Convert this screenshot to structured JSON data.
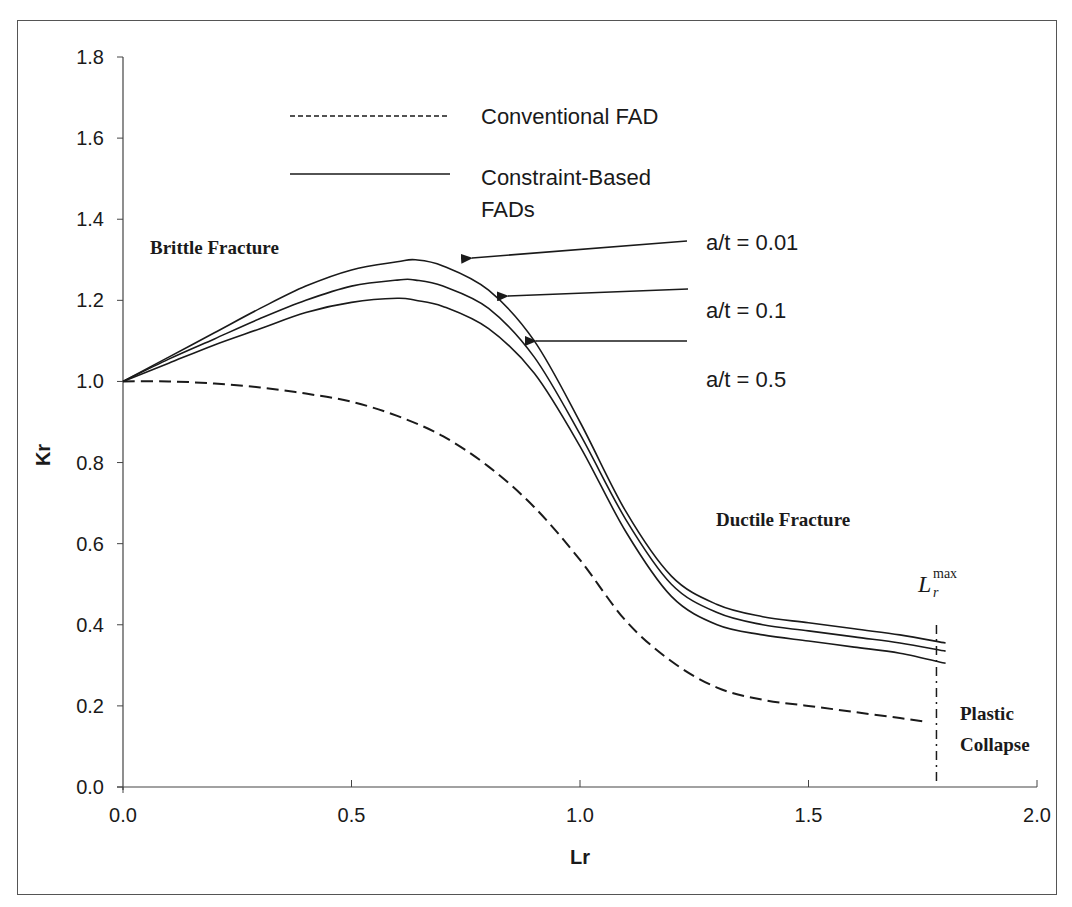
{
  "chart_data": {
    "type": "line",
    "title": "",
    "xlabel": "Lr",
    "ylabel": "Kr",
    "xlim": [
      0.0,
      2.0
    ],
    "ylim": [
      0.0,
      1.8
    ],
    "x_ticks": [
      "0.0",
      "0.5",
      "1.0",
      "1.5",
      "2.0"
    ],
    "y_ticks": [
      "0.0",
      "0.2",
      "0.4",
      "0.6",
      "0.8",
      "1.0",
      "1.2",
      "1.4",
      "1.6",
      "1.8"
    ],
    "grid": false,
    "legend_position": "top-center",
    "legend": [
      {
        "label": "Conventional FAD",
        "style": "dashed"
      },
      {
        "label": "Constraint-Based FADs",
        "style": "solid"
      }
    ],
    "series": [
      {
        "name": "Conventional FAD",
        "style": "dashed",
        "x": [
          0.0,
          0.1,
          0.2,
          0.3,
          0.4,
          0.5,
          0.6,
          0.7,
          0.8,
          0.9,
          1.0,
          1.1,
          1.2,
          1.3,
          1.4,
          1.5,
          1.6,
          1.7,
          1.76
        ],
        "y": [
          1.0,
          1.0,
          0.995,
          0.985,
          0.97,
          0.95,
          0.915,
          0.865,
          0.79,
          0.69,
          0.56,
          0.41,
          0.31,
          0.245,
          0.215,
          0.2,
          0.185,
          0.17,
          0.16
        ]
      },
      {
        "name": "a/t = 0.01",
        "style": "solid",
        "x": [
          0.0,
          0.1,
          0.2,
          0.3,
          0.4,
          0.5,
          0.6,
          0.64,
          0.7,
          0.8,
          0.9,
          1.0,
          1.1,
          1.2,
          1.3,
          1.4,
          1.5,
          1.6,
          1.7,
          1.8
        ],
        "y": [
          1.0,
          1.06,
          1.12,
          1.18,
          1.235,
          1.275,
          1.295,
          1.3,
          1.285,
          1.225,
          1.1,
          0.9,
          0.68,
          0.52,
          0.45,
          0.42,
          0.405,
          0.39,
          0.375,
          0.355
        ]
      },
      {
        "name": "a/t = 0.1",
        "style": "solid",
        "x": [
          0.0,
          0.1,
          0.2,
          0.3,
          0.4,
          0.5,
          0.6,
          0.64,
          0.7,
          0.8,
          0.9,
          1.0,
          1.1,
          1.2,
          1.3,
          1.4,
          1.5,
          1.6,
          1.7,
          1.8
        ],
        "y": [
          1.0,
          1.055,
          1.105,
          1.155,
          1.2,
          1.235,
          1.25,
          1.25,
          1.235,
          1.18,
          1.06,
          0.87,
          0.66,
          0.5,
          0.43,
          0.4,
          0.385,
          0.37,
          0.355,
          0.335
        ]
      },
      {
        "name": "a/t = 0.5",
        "style": "solid",
        "x": [
          0.0,
          0.1,
          0.2,
          0.3,
          0.4,
          0.5,
          0.6,
          0.64,
          0.7,
          0.8,
          0.9,
          1.0,
          1.1,
          1.2,
          1.3,
          1.4,
          1.5,
          1.6,
          1.7,
          1.8
        ],
        "y": [
          1.0,
          1.045,
          1.09,
          1.13,
          1.17,
          1.195,
          1.205,
          1.2,
          1.185,
          1.13,
          1.02,
          0.84,
          0.63,
          0.47,
          0.4,
          0.375,
          0.36,
          0.345,
          0.33,
          0.305
        ]
      }
    ],
    "annotations": [
      {
        "text": "Brittle Fracture",
        "x": 0.07,
        "y": 1.32
      },
      {
        "text": "Ductile Fracture",
        "x": 1.3,
        "y": 0.63
      },
      {
        "text": "Plastic Collapse",
        "x": 1.83,
        "y": 0.16
      },
      {
        "text": "Lr max",
        "x": 1.77,
        "y": 0.47,
        "note": "vertical dash-dot line at Lr = 1.78"
      },
      {
        "text": "a/t = 0.01",
        "arrow_to": [
          0.73,
          1.29
        ]
      },
      {
        "text": "a/t = 0.1",
        "arrow_to": [
          0.82,
          1.2
        ]
      },
      {
        "text": "a/t = 0.5",
        "arrow_to": [
          0.88,
          1.1
        ]
      }
    ],
    "lr_max": 1.78
  },
  "axes": {
    "xlabel": "Lr",
    "ylabel": "Kr",
    "x_ticks": [
      "0.0",
      "0.5",
      "1.0",
      "1.5",
      "2.0"
    ],
    "y_ticks": [
      "0.0",
      "0.2",
      "0.4",
      "0.6",
      "0.8",
      "1.0",
      "1.2",
      "1.4",
      "1.6",
      "1.8"
    ]
  },
  "legend": {
    "conventional": "Conventional FAD",
    "constraint_line1": "Constraint-Based",
    "constraint_line2": "FADs"
  },
  "labels": {
    "brittle": "Brittle Fracture",
    "ductile": "Ductile Fracture",
    "plastic_line1": "Plastic",
    "plastic_line2": "Collapse",
    "lrmax_main": "L",
    "lrmax_sub": "r",
    "lrmax_sup": "max",
    "at_001": "a/t = 0.01",
    "at_01": "a/t = 0.1",
    "at_05": "a/t = 0.5"
  },
  "colors": {
    "line": "#1a1a1a",
    "axis": "#444444",
    "background": "#ffffff"
  }
}
